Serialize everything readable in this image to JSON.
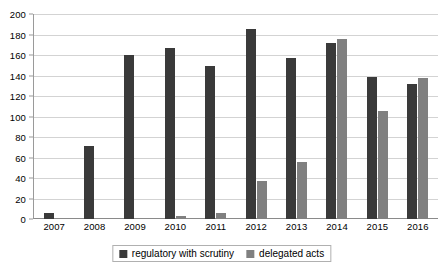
{
  "chart_data": {
    "type": "bar",
    "title": "",
    "subtitle": "",
    "xlabel": "",
    "ylabel": "",
    "categories": [
      "2007",
      "2008",
      "2009",
      "2010",
      "2011",
      "2012",
      "2013",
      "2014",
      "2015",
      "2016"
    ],
    "series": [
      {
        "name": "regulatory with scrutiny",
        "color": "#3a3a3a",
        "values": [
          6,
          71,
          160,
          167,
          149,
          185,
          157,
          172,
          139,
          132
        ]
      },
      {
        "name": "delegated acts",
        "color": "#808080",
        "values": [
          0,
          0,
          0,
          3,
          6,
          37,
          56,
          176,
          105,
          138
        ]
      }
    ],
    "ylim": [
      0,
      200
    ],
    "ytick_step": 20,
    "yticks": [
      "200",
      "180",
      "160",
      "140",
      "120",
      "100",
      "80",
      "60",
      "40",
      "20",
      "0"
    ],
    "grid": true,
    "legend_position": "bottom"
  },
  "legend": {
    "items": [
      {
        "label": "regulatory with scrutiny",
        "swatch": "series-a"
      },
      {
        "label": "delegated acts",
        "swatch": "series-b"
      }
    ]
  },
  "colors": {
    "series_a": "#3a3a3a",
    "series_b": "#808080",
    "gridline": "#d3d3d3",
    "axis": "#8a8a8a",
    "background": "#ffffff"
  }
}
